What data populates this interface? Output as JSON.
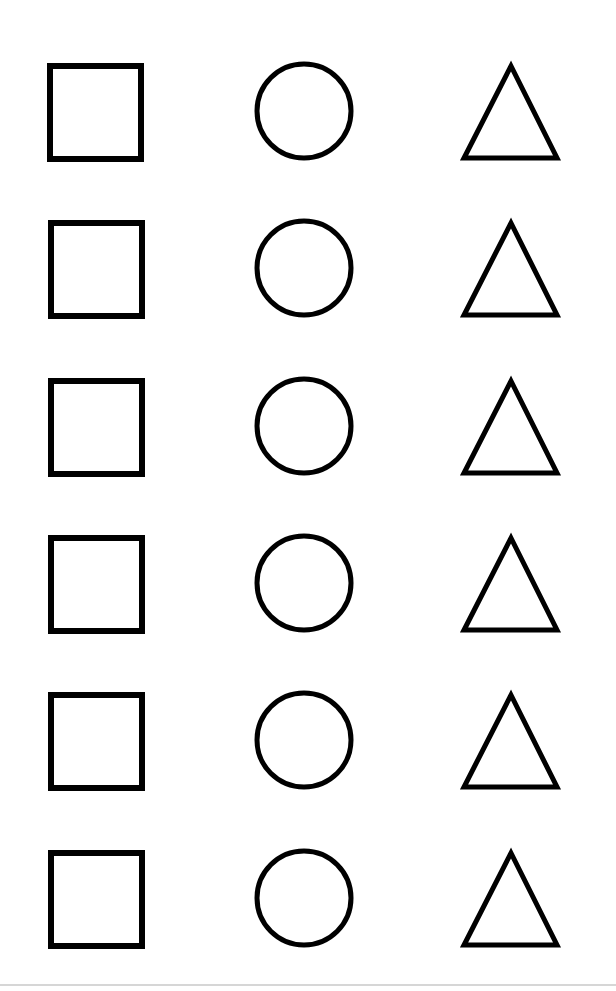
{
  "worksheet": {
    "background": "#ffffff",
    "stroke_color": "#000000",
    "columns": [
      "square",
      "circle",
      "triangle"
    ],
    "rows": [
      {
        "top": 60,
        "shapes": [
          "square",
          "circle",
          "triangle"
        ]
      },
      {
        "top": 217,
        "shapes": [
          "square",
          "circle",
          "triangle"
        ]
      },
      {
        "top": 375,
        "shapes": [
          "square",
          "circle",
          "triangle"
        ]
      },
      {
        "top": 532,
        "shapes": [
          "square",
          "circle",
          "triangle"
        ]
      },
      {
        "top": 689,
        "shapes": [
          "square",
          "circle",
          "triangle"
        ]
      },
      {
        "top": 847,
        "shapes": [
          "square",
          "circle",
          "triangle"
        ]
      }
    ]
  }
}
